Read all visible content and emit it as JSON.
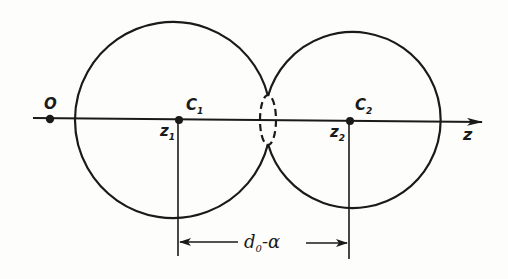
{
  "diagram": {
    "labels": {
      "origin": "O",
      "center1": "C",
      "center1_sub": "1",
      "center2": "C",
      "center2_sub": "2",
      "pos1": "z",
      "pos1_sub": "1",
      "pos2": "z",
      "pos2_sub": "2",
      "axis": "z",
      "distance_d": "d",
      "distance_sub": "0",
      "distance_rest": "-α"
    },
    "colors": {
      "ink": "#1a1a1a",
      "background": "#fdfdfc"
    }
  }
}
